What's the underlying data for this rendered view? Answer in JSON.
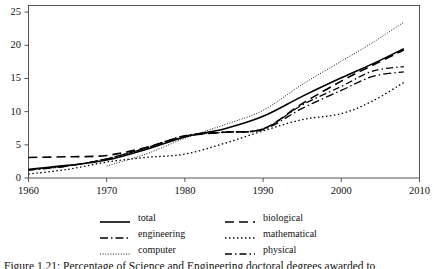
{
  "figure": {
    "background": "#ffffff",
    "line_color": "#000000",
    "axis_color": "#555555",
    "caption": "Figure 1.21: Percentage of Science and Engineering doctoral degrees awarded to"
  },
  "chart_data": {
    "type": "line",
    "title": "",
    "xlabel": "",
    "ylabel": "",
    "xlim": [
      1960,
      2010
    ],
    "ylim": [
      0,
      26
    ],
    "grid": false,
    "legend_position": "below-center",
    "xticks": [
      1960,
      1970,
      1980,
      1990,
      2000,
      2010
    ],
    "yticks": [
      0,
      5,
      10,
      15,
      20,
      25
    ],
    "xtick_labels": [
      "1960",
      "1970",
      "1980",
      "1990",
      "2000",
      "2010"
    ],
    "ytick_labels": [
      "0",
      "5",
      "10",
      "15",
      "20",
      "25"
    ],
    "series": [
      {
        "name": "total",
        "label": "total",
        "style": "solid",
        "width": 1.6,
        "dasharray": "",
        "x": [
          1960,
          1965,
          1970,
          1975,
          1980,
          1985,
          1990,
          1995,
          2000,
          2004,
          2008
        ],
        "values": [
          1.3,
          1.9,
          2.7,
          4.3,
          6.2,
          7.4,
          9.3,
          12.3,
          15.1,
          17.2,
          19.5
        ]
      },
      {
        "name": "biological",
        "label": "biological",
        "style": "dashed",
        "width": 1.6,
        "dasharray": "9,5",
        "x": [
          1960,
          1965,
          1970,
          1975,
          1980,
          1985,
          1990,
          1995,
          2000,
          2004,
          2008
        ],
        "values": [
          3.1,
          3.2,
          3.4,
          4.6,
          6.3,
          6.9,
          7.4,
          11.2,
          14.6,
          17.0,
          19.3
        ]
      },
      {
        "name": "engineering",
        "label": "engineering",
        "style": "dashdot",
        "width": 1.3,
        "dasharray": "8,3,1.5,3",
        "x": [
          1960,
          1965,
          1970,
          1975,
          1980,
          1985,
          1990,
          1995,
          2000,
          2004,
          2008
        ],
        "values": [
          1.2,
          1.8,
          2.9,
          4.5,
          6.4,
          6.9,
          7.3,
          10.5,
          13.2,
          15.3,
          16.0
        ]
      },
      {
        "name": "mathematical",
        "label": "mathematical",
        "style": "dotted",
        "width": 1.3,
        "dasharray": "1.5,2.5",
        "x": [
          1960,
          1965,
          1970,
          1975,
          1980,
          1985,
          1990,
          1995,
          2000,
          2004,
          2008
        ],
        "values": [
          0.6,
          1.3,
          2.4,
          3.1,
          3.6,
          5.2,
          7.1,
          8.8,
          9.7,
          11.6,
          14.4
        ]
      },
      {
        "name": "computer",
        "label": "computer",
        "style": "fine-dotted",
        "width": 0.9,
        "dasharray": "1,1.6",
        "x": [
          1970,
          1975,
          1980,
          1985,
          1990,
          1995,
          2000,
          2004,
          2008
        ],
        "values": [
          1.8,
          3.6,
          6.0,
          8.0,
          10.2,
          14.1,
          17.6,
          20.4,
          23.5
        ]
      },
      {
        "name": "physical",
        "label": "physical",
        "style": "longdashdot",
        "width": 1.3,
        "dasharray": "7,3,1.5,3",
        "x": [
          1960,
          1965,
          1970,
          1975,
          1980,
          1985,
          1990,
          1995,
          2000,
          2004,
          2008
        ],
        "values": [
          1.2,
          1.8,
          2.9,
          4.5,
          6.3,
          6.9,
          7.4,
          11.0,
          13.8,
          16.1,
          16.8
        ]
      }
    ]
  },
  "legend": {
    "rows": [
      {
        "left": {
          "key": "total",
          "label": "total"
        },
        "right": {
          "key": "biological",
          "label": "biological"
        }
      },
      {
        "left": {
          "key": "engineering",
          "label": "engineering"
        },
        "right": {
          "key": "mathematical",
          "label": "mathematical"
        }
      },
      {
        "left": {
          "key": "computer",
          "label": "computer"
        },
        "right": {
          "key": "physical",
          "label": "physical"
        }
      }
    ]
  }
}
